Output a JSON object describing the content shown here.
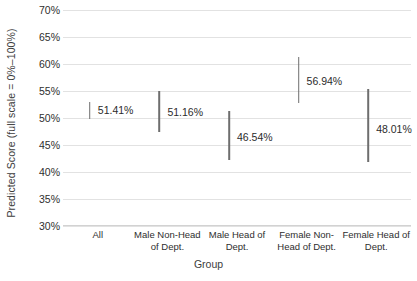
{
  "chart_data": {
    "type": "bar",
    "subtype": "error-bar-interval",
    "title": "",
    "xlabel": "Group",
    "ylabel": "Predicted Score (full scale = 0%–100%)",
    "ylim": [
      30,
      70
    ],
    "ytick_labels": [
      "70%",
      "65%",
      "60%",
      "55%",
      "50%",
      "45%",
      "40%",
      "35%",
      "30%"
    ],
    "ytick_values": [
      70,
      65,
      60,
      55,
      50,
      45,
      40,
      35,
      30
    ],
    "grid": true,
    "legend": "none",
    "categories": [
      "All",
      "Male Non-Head of Dept.",
      "Male Head of Dept.",
      "Female Non-Head of Dept.",
      "Female Head of Dept."
    ],
    "category_label_lines": [
      [
        "All"
      ],
      [
        "Male Non-Head",
        "of Dept."
      ],
      [
        "Male Head of",
        "Dept."
      ],
      [
        "Female Non-",
        "Head of Dept."
      ],
      [
        "Female Head of",
        "Dept."
      ]
    ],
    "values": [
      51.41,
      51.16,
      46.54,
      56.94,
      48.01
    ],
    "value_labels": [
      "51.41%",
      "51.16%",
      "46.54%",
      "56.94%",
      "48.01%"
    ],
    "ci_low": [
      49.9,
      47.5,
      42.2,
      52.8,
      41.8
    ],
    "ci_high": [
      53.0,
      55.0,
      51.3,
      61.3,
      55.4
    ],
    "colors": {
      "errorbar": "#6e6e6e",
      "gridline": "#e2e2e2",
      "axis": "#d2d2d2",
      "text": "#2e2e2e",
      "background": "#ffffff"
    }
  }
}
